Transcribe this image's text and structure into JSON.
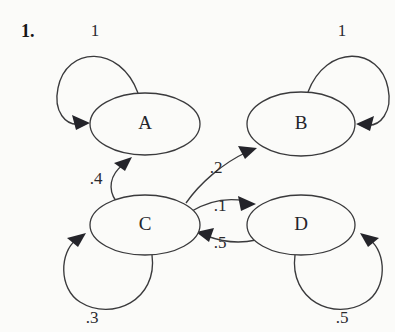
{
  "figure": {
    "item_number": "1.",
    "background_color": "#fbfbf9",
    "line_color": "#3a3a3c",
    "text_color": "#24242a"
  },
  "diagram": {
    "type": "state-transition-diagram",
    "nodes": [
      {
        "id": "A",
        "label": "A",
        "cx": 145,
        "cy": 124,
        "rx": 55,
        "ry": 31
      },
      {
        "id": "B",
        "label": "B",
        "cx": 301,
        "cy": 124,
        "rx": 54,
        "ry": 32
      },
      {
        "id": "C",
        "label": "C",
        "cx": 145,
        "cy": 225,
        "rx": 55,
        "ry": 30
      },
      {
        "id": "D",
        "label": "D",
        "cx": 301,
        "cy": 225,
        "rx": 54,
        "ry": 30
      }
    ],
    "edges": [
      {
        "from": "A",
        "to": "A",
        "label": "1",
        "kind": "self-loop",
        "label_x": 95,
        "label_y": 32
      },
      {
        "from": "B",
        "to": "B",
        "label": "1",
        "kind": "self-loop",
        "label_x": 342,
        "label_y": 32
      },
      {
        "from": "C",
        "to": "A",
        "label": ".4",
        "kind": "curve",
        "label_x": 96,
        "label_y": 180
      },
      {
        "from": "C",
        "to": "B",
        "label": ".2",
        "kind": "curve",
        "label_x": 216,
        "label_y": 169
      },
      {
        "from": "C",
        "to": "D",
        "label": ".1",
        "kind": "curve",
        "label_x": 220,
        "label_y": 207
      },
      {
        "from": "D",
        "to": "C",
        "label": ".5",
        "kind": "curve",
        "label_x": 220,
        "label_y": 244
      },
      {
        "from": "C",
        "to": "C",
        "label": ".3",
        "kind": "self-loop",
        "label_x": 92,
        "label_y": 319
      },
      {
        "from": "D",
        "to": "D",
        "label": ".5",
        "kind": "self-loop",
        "label_x": 342,
        "label_y": 319
      }
    ]
  }
}
